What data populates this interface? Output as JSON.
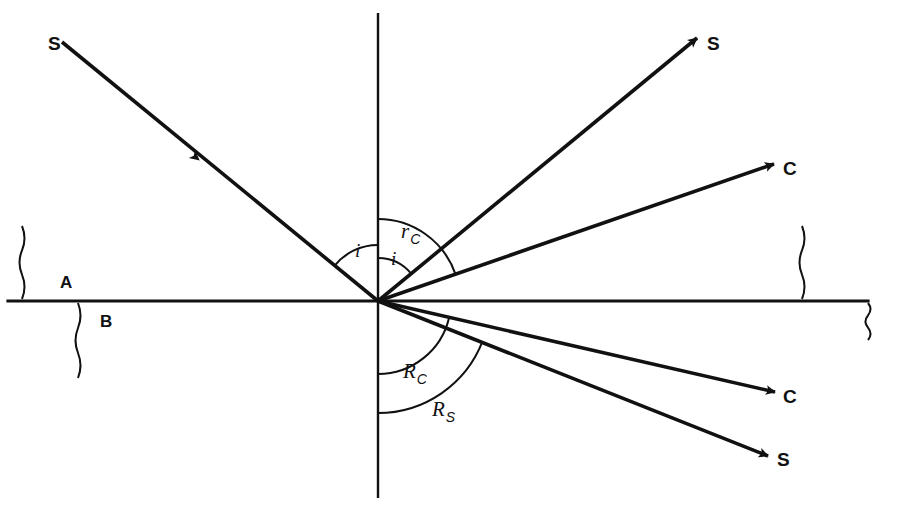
{
  "diagram": {
    "colors": {
      "ink": "#111111",
      "background": "#ffffff"
    },
    "geometry": {
      "origin_x": 378,
      "origin_y": 301,
      "interface_left_x": 8,
      "interface_right_x": 868,
      "normal_top_y": 13,
      "normal_bottom_y": 498
    },
    "media": [
      {
        "name": "medium-a",
        "label": "A",
        "x": 60,
        "y": 288,
        "side": "above"
      },
      {
        "name": "medium-b",
        "label": "B",
        "x": 100,
        "y": 327,
        "side": "below"
      }
    ],
    "rays": [
      {
        "name": "incident-sky-ray",
        "label": "S",
        "kind": "incident",
        "label_x": 48,
        "label_y": 50,
        "x1": 62,
        "y1": 42,
        "x2": 378,
        "y2": 301,
        "arrow_at": {
          "x": 199,
          "y": 160
        },
        "arrow_position": "midpoint"
      },
      {
        "name": "reflected-sky-ray",
        "label": "S",
        "kind": "reflected",
        "label_x": 707,
        "label_y": 50,
        "x1": 378,
        "y1": 301,
        "x2": 697,
        "y2": 38,
        "arrow_position": "end"
      },
      {
        "name": "reflected-cloud-ray",
        "label": "C",
        "kind": "reflected",
        "label_x": 783,
        "label_y": 175,
        "x1": 378,
        "y1": 301,
        "x2": 774,
        "y2": 164,
        "arrow_position": "end"
      },
      {
        "name": "refracted-cloud-ray",
        "label": "C",
        "kind": "refracted",
        "label_x": 783,
        "label_y": 403,
        "x1": 378,
        "y1": 301,
        "x2": 775,
        "y2": 392,
        "arrow_position": "end"
      },
      {
        "name": "refracted-sky-ray",
        "label": "S",
        "kind": "refracted",
        "label_x": 777,
        "label_y": 466,
        "x1": 378,
        "y1": 301,
        "x2": 768,
        "y2": 456,
        "arrow_position": "end"
      }
    ],
    "angles": [
      {
        "name": "angle-of-incidence-left",
        "main": "i",
        "sub": "",
        "label_x": 355,
        "label_y": 257,
        "radius": 56,
        "start_deg": 141,
        "end_deg": 90,
        "side": "above-left"
      },
      {
        "name": "angle-of-incidence-right",
        "main": "i",
        "sub": "",
        "label_x": 391,
        "label_y": 265,
        "radius": 43,
        "start_deg": 90,
        "end_deg": 39,
        "side": "above-right"
      },
      {
        "name": "angle-reflection-cloud",
        "main": "r",
        "sub": "C",
        "label_x": 401,
        "label_y": 238,
        "radius": 82,
        "start_deg": 90,
        "end_deg": 19,
        "side": "above-right"
      },
      {
        "name": "angle-refraction-cloud",
        "main": "R",
        "sub": "C",
        "label_x": 403,
        "label_y": 378,
        "radius": 73,
        "start_deg": -90,
        "end_deg": -13,
        "side": "below-right"
      },
      {
        "name": "angle-refraction-sky",
        "main": "R",
        "sub": "S",
        "label_x": 432,
        "label_y": 416,
        "radius": 112,
        "start_deg": -90,
        "end_deg": -21,
        "side": "below-right"
      }
    ],
    "break_marks": [
      {
        "name": "break-mark-left-upper",
        "x": 22,
        "y_top": 226,
        "y_bottom": 299
      },
      {
        "name": "break-mark-left-lower",
        "x": 78,
        "y_top": 303,
        "y_bottom": 378
      },
      {
        "name": "break-mark-right-upper",
        "x": 802,
        "y_top": 226,
        "y_bottom": 299
      },
      {
        "name": "break-mark-right-lower",
        "x": 868,
        "y_top": 303,
        "y_bottom": 340
      }
    ]
  }
}
